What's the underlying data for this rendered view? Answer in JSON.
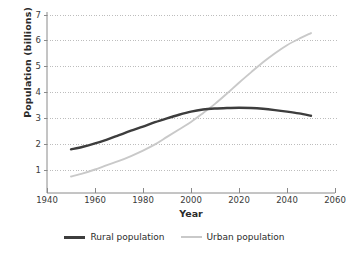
{
  "chart_data": {
    "type": "line",
    "title": "",
    "xlabel": "Year",
    "ylabel": "Population (billions)",
    "xlim": [
      1940,
      2060
    ],
    "ylim": [
      0,
      7
    ],
    "xticks": [
      "1940",
      "1960",
      "1980",
      "2000",
      "2020",
      "2040",
      "2060"
    ],
    "yticks": [
      "1",
      "2",
      "3",
      "4",
      "5",
      "6",
      "7"
    ],
    "grid": "horizontal-dotted",
    "legend_position": "bottom-center",
    "colors": {
      "rural": "#3d3d3d",
      "urban": "#c9c9c9",
      "gridline": "#bdbdbd",
      "axis": "#8a8a8a",
      "text": "#2b2b2b"
    },
    "series": [
      {
        "name": "Rural population",
        "color": "#3d3d3d",
        "x": [
          1950,
          1955,
          1960,
          1965,
          1970,
          1975,
          1980,
          1985,
          1990,
          1995,
          2000,
          2005,
          2010,
          2015,
          2020,
          2025,
          2030,
          2035,
          2040,
          2045,
          2050
        ],
        "values": [
          1.8,
          1.9,
          2.03,
          2.18,
          2.35,
          2.52,
          2.68,
          2.85,
          3.0,
          3.14,
          3.26,
          3.34,
          3.38,
          3.4,
          3.41,
          3.4,
          3.37,
          3.32,
          3.26,
          3.19,
          3.1
        ]
      },
      {
        "name": "Urban population",
        "color": "#c9c9c9",
        "x": [
          1950,
          1955,
          1960,
          1965,
          1970,
          1975,
          1980,
          1985,
          1990,
          1995,
          2000,
          2005,
          2010,
          2015,
          2020,
          2025,
          2030,
          2035,
          2040,
          2045,
          2050
        ],
        "values": [
          0.75,
          0.87,
          1.02,
          1.19,
          1.35,
          1.54,
          1.75,
          1.99,
          2.28,
          2.57,
          2.86,
          3.2,
          3.56,
          3.96,
          4.38,
          4.78,
          5.17,
          5.52,
          5.83,
          6.08,
          6.3
        ]
      }
    ],
    "annotations": {
      "crossover_year": 2007,
      "crossover_value": 3.35
    }
  },
  "legend": {
    "items": [
      {
        "label": "Rural population",
        "color": "#3d3d3d",
        "weight": "thick"
      },
      {
        "label": "Urban population",
        "color": "#c9c9c9",
        "weight": "thin"
      }
    ]
  }
}
